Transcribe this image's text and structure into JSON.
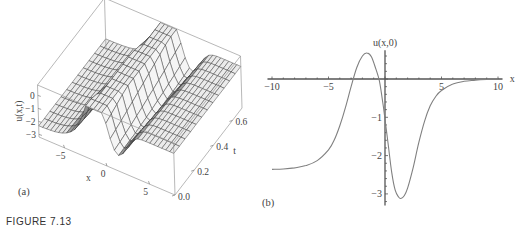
{
  "figure": {
    "caption": "FIGURE 7.13",
    "panel_a_label": "(a)",
    "panel_b_label": "(b)"
  },
  "chart_data": [
    {
      "type": "surface3d",
      "title": "",
      "panel": "(a)",
      "xlabel": "x",
      "ylabel": "t",
      "zlabel": "u(x,t)",
      "x_ticks": [
        "-5",
        "0",
        "5"
      ],
      "t_ticks": [
        "0.0",
        "0.2",
        "0.4",
        "0.6"
      ],
      "z_ticks": [
        "0",
        "-1",
        "-2",
        "-3"
      ],
      "xlim": [
        -8,
        8
      ],
      "tlim": [
        0,
        0.7
      ],
      "zlim": [
        -3.2,
        0.8
      ],
      "description": "Travelling wave surface: plateau at u≈-2.35 for x<-4, positive hump (~0.7) near x≈-1.5, deep trough (~-3.1) near x≈1.4, returning to u≈0 for x>5; profile shifts slightly in x as t increases",
      "color_accent": "#777777"
    },
    {
      "type": "line",
      "title": "",
      "panel": "(b)",
      "xlabel": "x",
      "ylabel": "u(x,0)",
      "x_ticks": [
        "-10",
        "-5",
        "5",
        "10"
      ],
      "y_ticks": [
        "-1",
        "-2",
        "-3"
      ],
      "xlim": [
        -10.5,
        10.5
      ],
      "ylim": [
        -3.3,
        0.8
      ],
      "grid": false,
      "x": [
        -10,
        -9,
        -8,
        -7,
        -6,
        -5,
        -4.5,
        -4,
        -3.5,
        -3,
        -2.5,
        -2,
        -1.6,
        -1.2,
        -0.8,
        -0.5,
        -0.2,
        0,
        0.3,
        0.6,
        0.9,
        1.2,
        1.4,
        1.7,
        2,
        2.5,
        3,
        3.5,
        4,
        4.5,
        5,
        6,
        7,
        8,
        9,
        10
      ],
      "values": [
        -2.36,
        -2.35,
        -2.32,
        -2.26,
        -2.13,
        -1.85,
        -1.6,
        -1.22,
        -0.75,
        -0.2,
        0.3,
        0.6,
        0.68,
        0.58,
        0.25,
        -0.05,
        -0.6,
        -1.05,
        -1.75,
        -2.45,
        -2.9,
        -3.08,
        -3.12,
        -3.05,
        -2.85,
        -2.3,
        -1.65,
        -1.1,
        -0.7,
        -0.45,
        -0.3,
        -0.13,
        -0.06,
        -0.03,
        -0.01,
        0.0
      ],
      "series_color": "#808080"
    }
  ]
}
